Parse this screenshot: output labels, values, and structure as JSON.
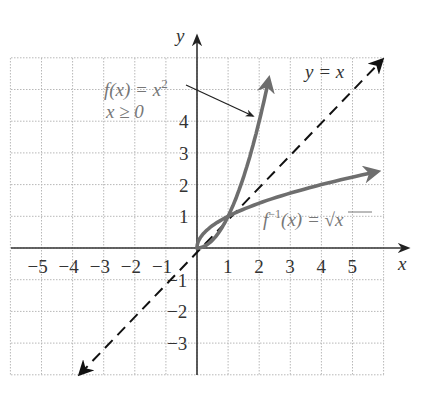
{
  "chart_data": {
    "type": "line",
    "title": "",
    "xlabel": "x",
    "ylabel": "y",
    "xlim": [
      -6,
      6
    ],
    "ylim": [
      -4,
      6
    ],
    "grid": true,
    "x_ticks": [
      "-5",
      "-4",
      "-3",
      "-2",
      "-1",
      "1",
      "2",
      "3",
      "4",
      "5"
    ],
    "y_ticks": [
      "-3",
      "-2",
      "-1",
      "1",
      "2",
      "3",
      "4"
    ],
    "series": [
      {
        "name": "f(x) = x^2, x ≥ 0",
        "x": [
          0,
          0.5,
          1,
          1.5,
          2,
          2.4
        ],
        "y": [
          0,
          0.25,
          1,
          2.25,
          4,
          5.76
        ],
        "style": "solid gray"
      },
      {
        "name": "f^-1(x) = √x",
        "x": [
          0,
          0.25,
          1,
          2.25,
          4,
          5.9
        ],
        "y": [
          0,
          0.5,
          1,
          1.5,
          2,
          2.43
        ],
        "style": "solid gray"
      },
      {
        "name": "y = x",
        "x": [
          -3.8,
          6
        ],
        "y": [
          -4,
          6
        ],
        "style": "dashed black"
      }
    ],
    "annotations": [
      {
        "text": "f(x) = x²",
        "sub": "x ≥ 0",
        "points_to": [
          1.9,
          3.6
        ]
      },
      {
        "text": "y = x"
      },
      {
        "text": "f⁻¹(x) = √x"
      }
    ]
  },
  "labels": {
    "x_axis": "x",
    "y_axis": "y",
    "f_line1_pre": "f(x) = x",
    "f_line1_sup": "2",
    "f_line2": "x ≥ 0",
    "identity": "y = x",
    "inv_pre": "f",
    "inv_sup": "−1",
    "inv_mid": "(x) = ",
    "inv_rad": "x"
  },
  "ticks": {
    "x": [
      {
        "v": -5,
        "t": "−5"
      },
      {
        "v": -4,
        "t": "−4"
      },
      {
        "v": -3,
        "t": "−3"
      },
      {
        "v": -2,
        "t": "−2"
      },
      {
        "v": -1,
        "t": "−1"
      },
      {
        "v": 1,
        "t": "1"
      },
      {
        "v": 2,
        "t": "2"
      },
      {
        "v": 3,
        "t": "3"
      },
      {
        "v": 4,
        "t": "4"
      },
      {
        "v": 5,
        "t": "5"
      }
    ],
    "y": [
      {
        "v": 4,
        "t": "4"
      },
      {
        "v": 3,
        "t": "3"
      },
      {
        "v": 2,
        "t": "2"
      },
      {
        "v": 1,
        "t": "1"
      },
      {
        "v": -1,
        "t": "−1"
      },
      {
        "v": -2,
        "t": "−2"
      },
      {
        "v": -3,
        "t": "−3"
      }
    ]
  },
  "colors": {
    "curve": "#6e6e6e",
    "axis": "#333333",
    "grid": "#b8b8b8",
    "label": "#777777"
  }
}
